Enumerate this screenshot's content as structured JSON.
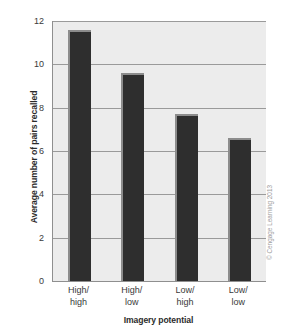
{
  "chart_data": {
    "type": "bar",
    "title": "",
    "subtitle": "",
    "categories": [
      "High/\nhigh",
      "High/\nlow",
      "Low/\nhigh",
      "Low/\nlow"
    ],
    "category_lines": [
      [
        "High/",
        "high"
      ],
      [
        "High/",
        "low"
      ],
      [
        "Low/",
        "high"
      ],
      [
        "Low/",
        "low"
      ]
    ],
    "values": [
      11.6,
      9.6,
      7.7,
      6.6
    ],
    "xlabel": "Imagery potential",
    "ylabel": "Average number of pairs recalled",
    "ylim": [
      0,
      12
    ],
    "ytick_values": [
      0,
      2,
      4,
      6,
      8,
      10,
      12
    ],
    "ytick_labels": [
      "0",
      "2",
      "4",
      "6",
      "8",
      "10",
      "12"
    ],
    "grid": true,
    "grid_axis": "y",
    "legend": false,
    "legend_position": "none",
    "bar_color": "#2e2e2e",
    "bar_highlight_color": "#8c8c8c",
    "plot_background": "#ececec",
    "gridline_color": "#9a9a9a",
    "axis_color": "#8f8f8f",
    "figure_background": "#ffffff"
  },
  "credit": {
    "text": "© Cengage Learning 2013",
    "color": "#9d9d9d"
  }
}
